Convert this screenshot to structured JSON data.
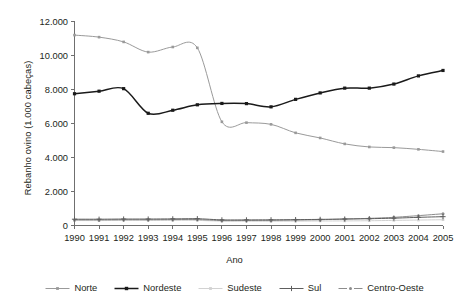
{
  "chart_data": {
    "type": "line",
    "title": "",
    "xlabel": "Ano",
    "ylabel": "Rebanho ovino (1.000 cabeças)",
    "x": [
      1990,
      1991,
      1992,
      1993,
      1994,
      1995,
      1996,
      1997,
      1998,
      1999,
      2000,
      2001,
      2002,
      2003,
      2004,
      2005
    ],
    "categories": [
      "1990",
      "1991",
      "1992",
      "1993",
      "1994",
      "1995",
      "1996",
      "1997",
      "1998",
      "1999",
      "2000",
      "2001",
      "2002",
      "2003",
      "2004",
      "2005"
    ],
    "xlim": [
      1990,
      2005
    ],
    "ylim": [
      0,
      12000
    ],
    "yticks": [
      0,
      2000,
      4000,
      6000,
      8000,
      10000,
      12000
    ],
    "ytick_labels": [
      "0",
      "2.000",
      "4.000",
      "6.000",
      "8.000",
      "10.000",
      "12.000"
    ],
    "grid": false,
    "legend_position": "bottom",
    "series": [
      {
        "name": "Norte",
        "color": "#9a9a9a",
        "marker": "square",
        "values": [
          11200,
          11080,
          10800,
          10200,
          10500,
          10450,
          6100,
          6050,
          5950,
          5450,
          5150,
          4800,
          4620,
          4580,
          4480,
          4350
        ]
      },
      {
        "name": "Nordeste",
        "color": "#1a1a1a",
        "marker": "square",
        "values": [
          7750,
          7900,
          8050,
          6600,
          6780,
          7100,
          7180,
          7170,
          6980,
          7420,
          7800,
          8080,
          8080,
          8320,
          8800,
          9120
        ]
      },
      {
        "name": "Sudeste",
        "color": "#d2d2d2",
        "marker": "square",
        "values": [
          290,
          290,
          300,
          300,
          300,
          300,
          255,
          250,
          250,
          255,
          265,
          270,
          280,
          300,
          320,
          340
        ]
      },
      {
        "name": "Sul",
        "color": "#5e5e5e",
        "marker": "cross",
        "values": [
          370,
          370,
          380,
          380,
          390,
          400,
          330,
          330,
          335,
          345,
          360,
          380,
          400,
          430,
          480,
          520
        ]
      },
      {
        "name": "Centro-Oeste",
        "color": "#8c8c8c",
        "marker": "dot",
        "values": [
          330,
          330,
          340,
          340,
          350,
          350,
          290,
          295,
          300,
          320,
          340,
          380,
          420,
          480,
          580,
          690
        ]
      }
    ]
  },
  "legend": {
    "items": [
      {
        "label": "Norte"
      },
      {
        "label": "Nordeste"
      },
      {
        "label": "Sudeste"
      },
      {
        "label": "Sul"
      },
      {
        "label": "Centro-Oeste"
      }
    ]
  }
}
